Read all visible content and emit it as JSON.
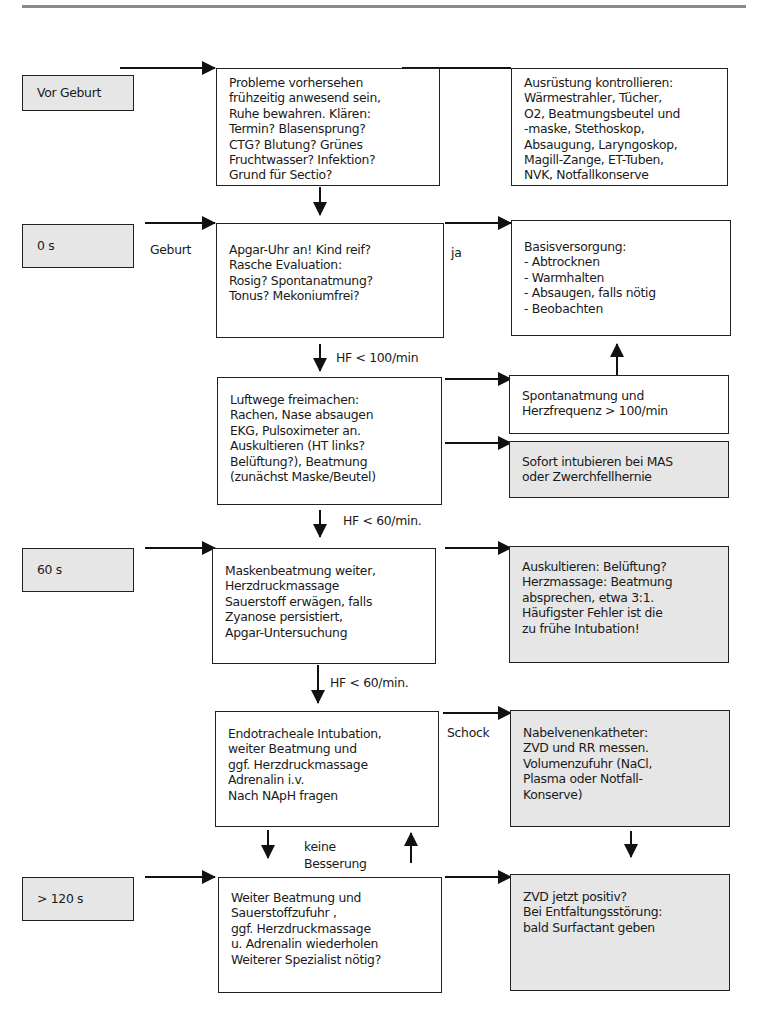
{
  "stages": [
    {
      "id": "vor-geburt",
      "label": "Vor Geburt"
    },
    {
      "id": "0s",
      "label": "0 s"
    },
    {
      "id": "60s",
      "label": "60 s"
    },
    {
      "id": "120s",
      "label": "> 120 s"
    }
  ],
  "boxes": {
    "probleme": {
      "lines": [
        "Probleme vorhersehen",
        "frühzeitig anwesend sein,",
        "Ruhe bewahren. Klären:",
        "Termin? Blasensprung?",
        "CTG? Blutung? Grünes",
        "Fruchtwasser? Infektion?",
        "Grund für Sectio?"
      ]
    },
    "ausruestung": {
      "lines": [
        "Ausrüstung kontrollieren:",
        "Wärmestrahler, Tücher,",
        "O2, Beatmungsbeutel und",
        "-maske, Stethoskop,",
        "Absaugung, Laryngoskop,",
        "Magill-Zange, ET-Tuben,",
        "NVK, Notfallkonserve"
      ]
    },
    "apgar": {
      "lines": [
        "Apgar-Uhr an! Kind reif?",
        "Rasche Evaluation:",
        "Rosig? Spontanatmung?",
        "Tonus? Mekoniumfrei?"
      ]
    },
    "basis": {
      "lines": [
        "Basisversorgung:",
        "- Abtrocknen",
        "- Warmhalten",
        "- Absaugen, falls nötig",
        "- Beobachten"
      ]
    },
    "luftwege": {
      "lines": [
        "Luftwege freimachen:",
        "Rachen, Nase  absaugen",
        "EKG, Pulsoximeter an.",
        "Auskultieren (HT links?",
        "Belüftung?), Beatmung",
        "(zunächst Maske/Beutel)"
      ]
    },
    "spontan": {
      "lines": [
        "Spontanatmung und",
        "Herzfrequenz > 100/min"
      ]
    },
    "sofort": {
      "lines": [
        "Sofort intubieren bei MAS",
        "oder Zwerchfellhernie"
      ]
    },
    "masken": {
      "lines": [
        "Maskenbeatmung weiter,",
        "Herzdruckmassage",
        "Sauerstoff erwägen, falls",
        "Zyanose persistiert,",
        "Apgar-Untersuchung"
      ]
    },
    "auskultieren": {
      "lines": [
        "Auskultieren: Belüftung?",
        "Herzmassage: Beatmung",
        "absprechen, etwa 3:1.",
        "Häufigster Fehler ist die",
        "zu frühe Intubation!"
      ]
    },
    "endo": {
      "lines": [
        "Endotracheale Intubation,",
        "weiter Beatmung  und",
        "ggf. Herzdruckmassage",
        "Adrenalin i.v.",
        "Nach NApH fragen"
      ]
    },
    "nabel": {
      "lines": [
        "Nabelvenenkatheter:",
        "ZVD und RR messen.",
        "Volumenzufuhr (NaCl,",
        "Plasma oder Notfall-",
        "Konserve)"
      ]
    },
    "weiter": {
      "lines": [
        "Weiter Beatmung und",
        "Sauerstoffzufuhr ,",
        "ggf. Herzdruckmassage",
        "u. Adrenalin wiederholen",
        "Weiterer Spezialist nötig?"
      ]
    },
    "zvd": {
      "lines": [
        "ZVD jetzt positiv?",
        "Bei Entfaltungsstörung:",
        "bald Surfactant geben"
      ]
    }
  },
  "labels": {
    "geburt": "Geburt",
    "ja": "ja",
    "hf100": "HF < 100/min",
    "hf60a": "HF < 60/min.",
    "hf60b": "HF < 60/min.",
    "schock": "Schock",
    "keine": "keine",
    "besserung": "Besserung"
  },
  "colors": {
    "grey_fill": "#e6e6e6",
    "line": "#222222",
    "rule": "#8a8a8a"
  }
}
